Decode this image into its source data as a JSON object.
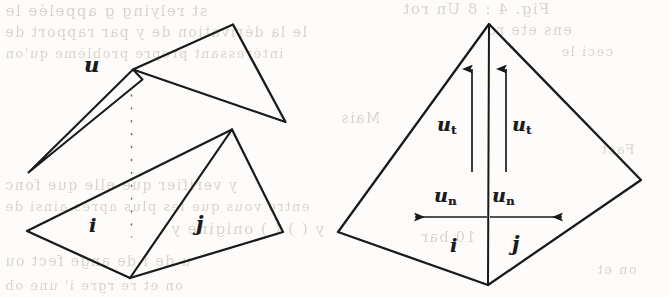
{
  "figure": {
    "kind": "scanned-mathematical-diagram",
    "ink_color": "#1a1a1a",
    "paper_color": "#fdfcfa",
    "bleed_color": "#b9b4ad"
  },
  "left_diagram": {
    "name": "folded-triangle-pair",
    "labels": {
      "u": "u",
      "i": "i",
      "j": "j"
    },
    "geometry": {
      "sliver_triangle": "28,172 133,70 141,78",
      "upper_triangle": "133,70 233,25 285,122",
      "lower_quad": "27,231 232,130 283,232 130,278",
      "lower_diagonal": "232,130 130,278",
      "dotted_seam": {
        "x": 131,
        "y_top": 95,
        "y_bottom": 237
      }
    }
  },
  "right_diagram": {
    "name": "kite-with-velocity-vectors",
    "labels": {
      "u_t_left": {
        "base": "u",
        "sub": "t"
      },
      "u_t_right": {
        "base": "u",
        "sub": "t"
      },
      "u_n_left": {
        "base": "u",
        "sub": "n"
      },
      "u_n_right": {
        "base": "u",
        "sub": "n"
      },
      "i": "i",
      "j": "j"
    },
    "geometry": {
      "kite": "489,24 641,180 488,285 338,232",
      "center_seam": "489,24 488,285",
      "arrow_tangential_left": {
        "x": 472,
        "y_tail": 172,
        "y_tip": 68
      },
      "arrow_tangential_right": {
        "x": 506,
        "y_tail": 172,
        "y_tip": 68
      },
      "arrow_normal_left": {
        "y": 217,
        "x_tail": 487,
        "x_tip": 414
      },
      "arrow_normal_right": {
        "y": 217,
        "x_tail": 490,
        "x_tip": 563
      }
    }
  },
  "background_bleed": {
    "lines": [
      {
        "text": "st relying g  appelée  le",
        "x": 4,
        "y": 12,
        "size": 15
      },
      {
        "text": "le la dérivation de y par rapport de",
        "x": 4,
        "y": 34,
        "size": 14
      },
      {
        "text": "intéressant propre  problème qu'on",
        "x": 4,
        "y": 55,
        "size": 13
      },
      {
        "text": "Fig. 4 : 8  Un  rot",
        "x": 402,
        "y": 10,
        "size": 15
      },
      {
        "text": "ens  ete  ro",
        "x": 486,
        "y": 32,
        "size": 14
      },
      {
        "text": "ceci  le",
        "x": 560,
        "y": 52,
        "size": 13
      },
      {
        "text": "Mais",
        "x": 340,
        "y": 118,
        "size": 14
      },
      {
        "text": "y verifier que  elle  que  fonc",
        "x": 4,
        "y": 185,
        "size": 14
      },
      {
        "text": "entre  vous  que  les  plus  apres  ainsi  de",
        "x": 4,
        "y": 207,
        "size": 13
      },
      {
        "text": "y  (  )  (  )  onigine  y",
        "x": 170,
        "y": 230,
        "size": 15
      },
      {
        "text": "u  de  i  de  ange  fect  ou",
        "x": 4,
        "y": 262,
        "size": 14
      },
      {
        "text": "on  et  re  rgre  i'  une  ob",
        "x": 4,
        "y": 286,
        "size": 13
      },
      {
        "text": "10  bar",
        "x": 420,
        "y": 237,
        "size": 14
      },
      {
        "text": "Fact",
        "x": 600,
        "y": 150,
        "size": 13
      },
      {
        "text": "on  et",
        "x": 596,
        "y": 270,
        "size": 13
      }
    ]
  }
}
